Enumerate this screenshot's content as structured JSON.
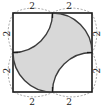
{
  "figure": {
    "canvas": {
      "width": 105,
      "height": 111,
      "background": "#ffffff"
    },
    "square": {
      "name": "outer-square",
      "left": 13,
      "top": 13,
      "side": 79,
      "stroke_color": "#1a1a1a",
      "stroke_width": 1.6,
      "fill": "#ffffff"
    },
    "shaded_region": {
      "name": "astroid-star",
      "fill_color": "#d8d8d8",
      "stroke_color": "#3c3c3c",
      "stroke_width": 1.4,
      "description": "region bounded by four quarter-circle arcs of radius 2 centered at the square's corners"
    },
    "arcs": {
      "radius": 2,
      "count": 4,
      "centers": [
        "top-left corner",
        "top-right corner",
        "bottom-right corner",
        "bottom-left corner"
      ],
      "stroke_color": "#3c3c3c"
    },
    "guide_arcs": {
      "name": "dashed-guide-arcs",
      "stroke_color": "#9a9a9a",
      "stroke_width": 0.9,
      "dash": "2,1.6",
      "count": 8,
      "description": "light dashed arcs drawn outside each half-edge of the square"
    },
    "tick_marks": {
      "name": "edge-midpoint-ticks",
      "stroke_color": "#1a1a1a",
      "count": 4
    },
    "labels": [
      {
        "id": "top-left",
        "text": "2",
        "x": 32,
        "y": 3,
        "rotated": false
      },
      {
        "id": "top-right",
        "text": "2",
        "x": 69,
        "y": 3,
        "rotated": false
      },
      {
        "id": "right-top",
        "text": "2",
        "x": 94,
        "y": 30,
        "rotated": true
      },
      {
        "id": "right-bottom",
        "text": "2",
        "x": 94,
        "y": 67,
        "rotated": true
      },
      {
        "id": "bottom-right",
        "text": "2",
        "x": 69,
        "y": 97,
        "rotated": false
      },
      {
        "id": "bottom-left",
        "text": "2",
        "x": 32,
        "y": 97,
        "rotated": false
      },
      {
        "id": "left-bottom",
        "text": "2",
        "x": 4,
        "y": 67,
        "rotated": true
      },
      {
        "id": "left-top",
        "text": "2",
        "x": 4,
        "y": 30,
        "rotated": true
      }
    ]
  }
}
